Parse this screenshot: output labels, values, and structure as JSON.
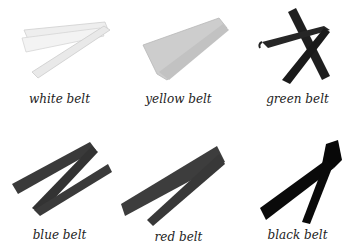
{
  "belts": [
    {
      "label": "white belt",
      "color": "#e8e8e8"
    },
    {
      "label": "yellow belt",
      "color": "#cfcfcf"
    },
    {
      "label": "green belt",
      "color": "#222222"
    },
    {
      "label": "blue belt",
      "color": "#3a3a3a"
    },
    {
      "label": "red belt",
      "color": "#3d3d3d"
    },
    {
      "label": "black belt",
      "color": "#0a0a0a"
    }
  ]
}
